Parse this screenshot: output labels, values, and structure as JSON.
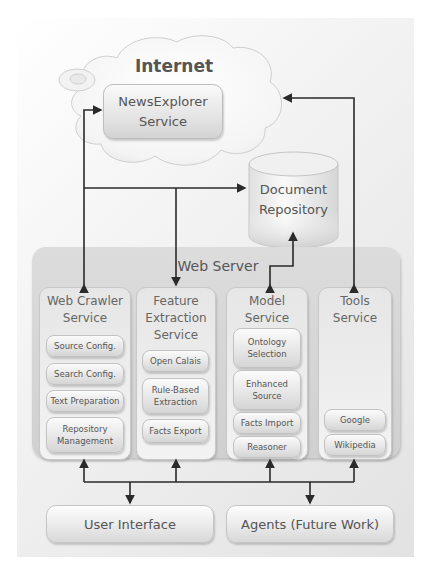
{
  "diagram": {
    "cloud": {
      "title": "Internet",
      "service": "NewsExplorer Service",
      "service_lines": [
        "NewsExplorer",
        "Service"
      ]
    },
    "repository": {
      "label": "Document Repository",
      "lines": [
        "Document",
        "Repository"
      ]
    },
    "web_server": {
      "title": "Web Server",
      "services": [
        {
          "title": "Web Crawler Service",
          "lines": [
            "Web Crawler",
            "Service"
          ],
          "components": [
            {
              "lines": [
                "Source Config."
              ]
            },
            {
              "lines": [
                "Search Config."
              ]
            },
            {
              "lines": [
                "Text Preparation"
              ]
            },
            {
              "lines": [
                "Repository",
                "Management"
              ]
            }
          ]
        },
        {
          "title": "Feature Extraction Service",
          "lines": [
            "Feature",
            "Extraction",
            "Service"
          ],
          "components": [
            {
              "lines": [
                "Open Calais"
              ]
            },
            {
              "lines": [
                "Rule-Based",
                "Extraction"
              ]
            },
            {
              "lines": [
                "Facts Export"
              ]
            }
          ]
        },
        {
          "title": "Model Service",
          "lines": [
            "Model",
            "Service"
          ],
          "components": [
            {
              "lines": [
                "Ontology",
                "Selection"
              ]
            },
            {
              "lines": [
                "Enhanced",
                "Source"
              ]
            },
            {
              "lines": [
                "Facts Import"
              ]
            },
            {
              "lines": [
                "Reasoner"
              ]
            }
          ]
        },
        {
          "title": "Tools Service",
          "lines": [
            "Tools",
            "Service"
          ],
          "components": [
            {
              "lines": [
                "Google"
              ]
            },
            {
              "lines": [
                "Wikipedia"
              ]
            }
          ]
        }
      ]
    },
    "clients": [
      {
        "label": "User Interface"
      },
      {
        "label": "Agents (Future Work)"
      }
    ],
    "colors": {
      "line": "#2a2a2a",
      "text": "#555555",
      "panel": "#e4e4e4"
    },
    "connections": [
      {
        "from": "Web Crawler Service",
        "to": "NewsExplorer Service",
        "bidirectional": true
      },
      {
        "from": "Web Crawler Service",
        "to": "Document Repository"
      },
      {
        "from": "Feature Extraction Service",
        "to": "Document Repository"
      },
      {
        "from": "Model Service",
        "to": "Document Repository",
        "bidirectional": true
      },
      {
        "from": "Tools Service",
        "to": "Internet",
        "bidirectional": true
      },
      {
        "from": "Web Server services",
        "to": "User Interface",
        "bidirectional": true
      },
      {
        "from": "Web Server services",
        "to": "Agents (Future Work)",
        "bidirectional": true
      }
    ]
  }
}
